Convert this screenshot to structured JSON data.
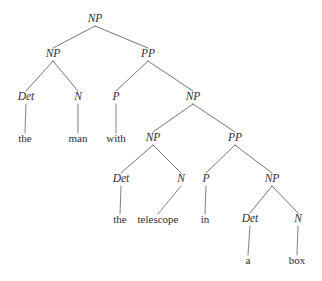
{
  "diagram": {
    "sentence": "the man with the telescope in a box",
    "colors": {
      "background": "#ffffff",
      "text": "#2e2e33",
      "line": "#5a5a62"
    }
  },
  "nodes": [
    {
      "id": "np-root",
      "label": "NP",
      "kind": "nonterminal",
      "x": 95,
      "y": 22,
      "level": 1
    },
    {
      "id": "np-1",
      "label": "NP",
      "kind": "nonterminal",
      "x": 53,
      "y": 57,
      "level": 2
    },
    {
      "id": "pp-1",
      "label": "PP",
      "kind": "nonterminal",
      "x": 148,
      "y": 57,
      "level": 2
    },
    {
      "id": "det-1",
      "label": "Det",
      "kind": "nonterminal",
      "x": 26,
      "y": 100,
      "level": 3
    },
    {
      "id": "n-1",
      "label": "N",
      "kind": "nonterminal",
      "x": 78,
      "y": 100,
      "level": 3
    },
    {
      "id": "p-1",
      "label": "P",
      "kind": "nonterminal",
      "x": 116,
      "y": 100,
      "level": 3
    },
    {
      "id": "np-2",
      "label": "NP",
      "kind": "nonterminal",
      "x": 193,
      "y": 100,
      "level": 3
    },
    {
      "id": "w-the-1",
      "label": "the",
      "kind": "terminal",
      "x": 25,
      "y": 142,
      "level": 4
    },
    {
      "id": "w-man",
      "label": "man",
      "kind": "terminal",
      "x": 78,
      "y": 142,
      "level": 4
    },
    {
      "id": "w-with",
      "label": "with",
      "kind": "terminal",
      "x": 116,
      "y": 142,
      "level": 4
    },
    {
      "id": "np-3",
      "label": "NP",
      "kind": "nonterminal",
      "x": 153,
      "y": 141,
      "level": 4
    },
    {
      "id": "pp-2",
      "label": "PP",
      "kind": "nonterminal",
      "x": 235,
      "y": 141,
      "level": 4
    },
    {
      "id": "det-2",
      "label": "Det",
      "kind": "nonterminal",
      "x": 121,
      "y": 182,
      "level": 5
    },
    {
      "id": "n-2",
      "label": "N",
      "kind": "nonterminal",
      "x": 181,
      "y": 182,
      "level": 5
    },
    {
      "id": "p-2",
      "label": "P",
      "kind": "nonterminal",
      "x": 206,
      "y": 182,
      "level": 5
    },
    {
      "id": "np-4",
      "label": "NP",
      "kind": "nonterminal",
      "x": 272,
      "y": 182,
      "level": 5
    },
    {
      "id": "w-the-2",
      "label": "the",
      "kind": "terminal",
      "x": 120,
      "y": 223,
      "level": 6
    },
    {
      "id": "w-telescope",
      "label": "telescope",
      "kind": "terminal",
      "x": 158,
      "y": 223,
      "level": 6
    },
    {
      "id": "w-in",
      "label": "in",
      "kind": "terminal",
      "x": 205,
      "y": 223,
      "level": 6
    },
    {
      "id": "det-3",
      "label": "Det",
      "kind": "nonterminal",
      "x": 250,
      "y": 222,
      "level": 6
    },
    {
      "id": "n-3",
      "label": "N",
      "kind": "nonterminal",
      "x": 298,
      "y": 222,
      "level": 6
    },
    {
      "id": "w-a",
      "label": "a",
      "kind": "terminal",
      "x": 248,
      "y": 264,
      "level": 7
    },
    {
      "id": "w-box",
      "label": "box",
      "kind": "terminal",
      "x": 297,
      "y": 264,
      "level": 7
    }
  ],
  "edges": [
    {
      "from": "np-root",
      "to": "np-1",
      "type": "branch"
    },
    {
      "from": "np-root",
      "to": "pp-1",
      "type": "branch"
    },
    {
      "from": "np-1",
      "to": "det-1",
      "type": "branch"
    },
    {
      "from": "np-1",
      "to": "n-1",
      "type": "branch"
    },
    {
      "from": "pp-1",
      "to": "p-1",
      "type": "branch"
    },
    {
      "from": "pp-1",
      "to": "np-2",
      "type": "branch"
    },
    {
      "from": "det-1",
      "to": "w-the-1",
      "type": "stem"
    },
    {
      "from": "n-1",
      "to": "w-man",
      "type": "stem"
    },
    {
      "from": "p-1",
      "to": "w-with",
      "type": "stem"
    },
    {
      "from": "np-2",
      "to": "np-3",
      "type": "branch"
    },
    {
      "from": "np-2",
      "to": "pp-2",
      "type": "branch"
    },
    {
      "from": "np-3",
      "to": "det-2",
      "type": "branch"
    },
    {
      "from": "np-3",
      "to": "n-2",
      "type": "branch"
    },
    {
      "from": "pp-2",
      "to": "p-2",
      "type": "branch"
    },
    {
      "from": "pp-2",
      "to": "np-4",
      "type": "branch"
    },
    {
      "from": "det-2",
      "to": "w-the-2",
      "type": "stem"
    },
    {
      "from": "n-2",
      "to": "w-telescope",
      "type": "stem"
    },
    {
      "from": "p-2",
      "to": "w-in",
      "type": "stem"
    },
    {
      "from": "np-4",
      "to": "det-3",
      "type": "branch"
    },
    {
      "from": "np-4",
      "to": "n-3",
      "type": "branch"
    },
    {
      "from": "det-3",
      "to": "w-a",
      "type": "stem"
    },
    {
      "from": "n-3",
      "to": "w-box",
      "type": "stem"
    }
  ]
}
